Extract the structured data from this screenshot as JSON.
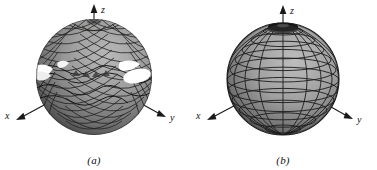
{
  "figure": {
    "background_color": "#ffffff",
    "line_color": "#1a1a1a",
    "surface_color": "#9a9a9a",
    "surface_dark_color": "#4a4a4a",
    "surface_light_color": "#c8c8c8",
    "gap_color": "#ffffff",
    "panels": [
      {
        "id": "a",
        "caption": "(a)",
        "sphere_type": "distorted-mesh-sphere",
        "description": "sphere with rippled crosshatch mesh and white gaps near equator",
        "axes": [
          {
            "name": "x",
            "label": "x",
            "direction": "lower-left"
          },
          {
            "name": "y",
            "label": "y",
            "direction": "lower-right"
          },
          {
            "name": "z",
            "label": "z",
            "direction": "up"
          }
        ]
      },
      {
        "id": "b",
        "caption": "(b)",
        "sphere_type": "regular-latlon-sphere",
        "description": "sphere with regular latitude longitude grid and dark polar cap",
        "axes": [
          {
            "name": "x",
            "label": "x",
            "direction": "lower-left"
          },
          {
            "name": "y",
            "label": "y",
            "direction": "lower-right"
          },
          {
            "name": "z",
            "label": "z",
            "direction": "up"
          }
        ]
      }
    ]
  }
}
